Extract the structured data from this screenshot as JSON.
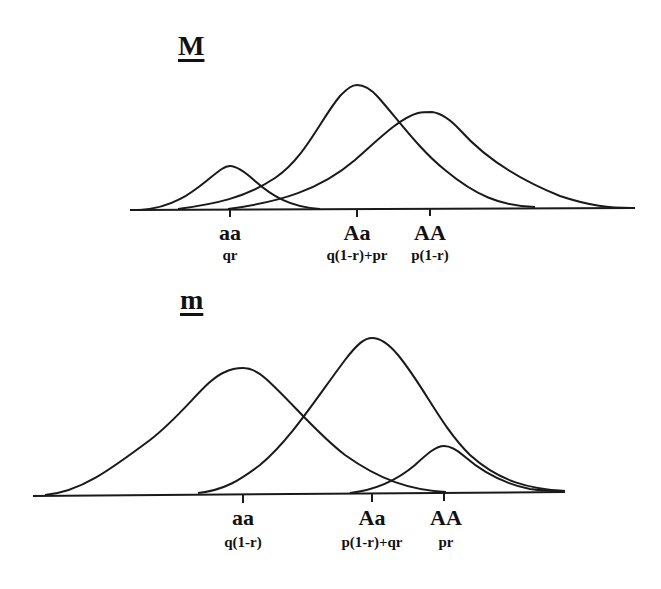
{
  "panels": [
    {
      "title": "M",
      "genotypes": [
        {
          "label": "aa",
          "freq": "qr",
          "tick_x": 230,
          "peak_y": 166
        },
        {
          "label": "Aa",
          "freq": "q(1-r)+pr",
          "tick_x": 357,
          "peak_y": 85
        },
        {
          "label": "AA",
          "freq": "p(1-r)",
          "tick_x": 430,
          "peak_y": 112
        }
      ]
    },
    {
      "title": "m",
      "genotypes": [
        {
          "label": "aa",
          "freq": "q(1-r)",
          "tick_x": 243,
          "peak_y": 368
        },
        {
          "label": "Aa",
          "freq": "p(1-r)+qr",
          "tick_x": 372,
          "peak_y": 338
        },
        {
          "label": "AA",
          "freq": "pr",
          "tick_x": 444,
          "peak_y": 446
        }
      ]
    }
  ],
  "colors": {
    "line": "#1a1a1a",
    "background": "#ffffff"
  }
}
